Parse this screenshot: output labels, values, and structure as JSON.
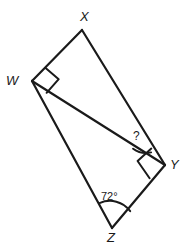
{
  "figure": {
    "type": "geometry-diagram",
    "background_color": "#ffffff",
    "stroke_color": "#1a1a1a",
    "text_color": "#1a1a1a"
  },
  "vertices": {
    "X": {
      "label": "X",
      "x": 82,
      "y": 30
    },
    "W": {
      "label": "W",
      "x": 32,
      "y": 81
    },
    "Y": {
      "label": "Y",
      "x": 165,
      "y": 165
    },
    "Z": {
      "label": "Z",
      "x": 112,
      "y": 228
    }
  },
  "edges": [
    {
      "name": "WX",
      "from": "W",
      "to": "X"
    },
    {
      "name": "XY",
      "from": "X",
      "to": "Y"
    },
    {
      "name": "WY",
      "from": "W",
      "to": "Y"
    },
    {
      "name": "WZ",
      "from": "W",
      "to": "Z"
    },
    {
      "name": "ZY",
      "from": "Z",
      "to": "Y"
    }
  ],
  "angles": {
    "at_W": {
      "label": "",
      "marker": "right-angle-square",
      "vertex": "W",
      "measure": "90"
    },
    "at_Y_right": {
      "label": "",
      "marker": "right-angle-square",
      "vertex": "Y",
      "measure": "90"
    },
    "at_Y_unknown": {
      "label": "?",
      "marker": "arc",
      "vertex": "Y"
    },
    "at_Z": {
      "label": "72°",
      "marker": "arc",
      "vertex": "Z",
      "measure": "72"
    }
  }
}
